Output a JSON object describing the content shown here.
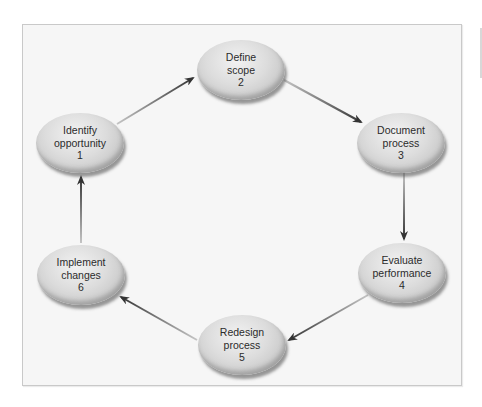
{
  "diagram": {
    "type": "cycle",
    "colors": {
      "frame_border": "#c9c9c9",
      "frame_background": "#f6f6f6",
      "node_fill": "#d4d4d4",
      "node_shadow": "#7a7a7a",
      "arrow_tail": "#bdbdbd",
      "arrow_head": "#3a3a3a",
      "text": "#2b2b2b"
    },
    "nodes": [
      {
        "id": 1,
        "line1": "Identify",
        "line2": "opportunity",
        "number": "1"
      },
      {
        "id": 2,
        "line1": "Define",
        "line2": "scope",
        "number": "2"
      },
      {
        "id": 3,
        "line1": "Document",
        "line2": "process",
        "number": "3"
      },
      {
        "id": 4,
        "line1": "Evaluate",
        "line2": "performance",
        "number": "4"
      },
      {
        "id": 5,
        "line1": "Redesign",
        "line2": "process",
        "number": "5"
      },
      {
        "id": 6,
        "line1": "Implement",
        "line2": "changes",
        "number": "6"
      }
    ],
    "edges": [
      {
        "from": 1,
        "to": 2
      },
      {
        "from": 2,
        "to": 3
      },
      {
        "from": 3,
        "to": 4
      },
      {
        "from": 4,
        "to": 5
      },
      {
        "from": 5,
        "to": 6
      },
      {
        "from": 6,
        "to": 1
      }
    ]
  }
}
